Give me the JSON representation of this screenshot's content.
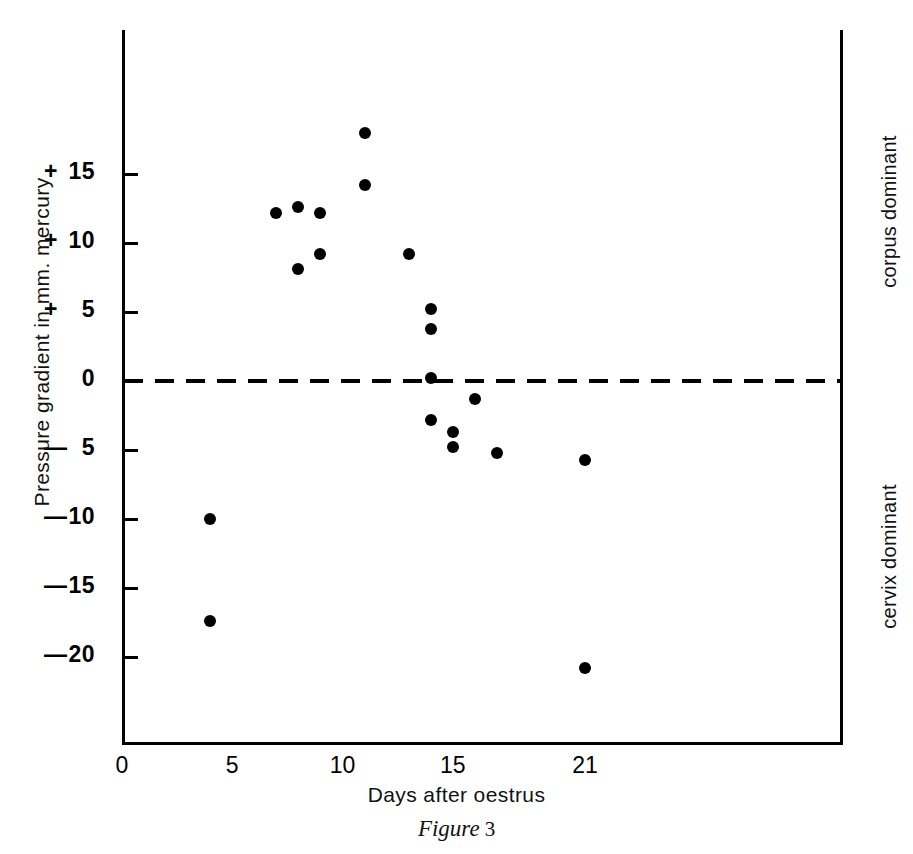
{
  "figure": {
    "caption_label": "Figure",
    "caption_number": "3"
  },
  "chart_data": {
    "type": "scatter",
    "title": "",
    "xlabel": "Days after oestrus",
    "ylabel": "Pressure gradient in mm. mercury",
    "xlim": [
      0,
      21.6
    ],
    "ylim": [
      -21.5,
      19.5
    ],
    "grid": false,
    "legend": "none",
    "xticks": [
      0,
      5,
      10,
      15,
      21
    ],
    "xtick_labels": [
      "0",
      "5",
      "10",
      "15",
      "21"
    ],
    "yticks": [
      15,
      10,
      5,
      0,
      -5,
      -10,
      -15,
      -20
    ],
    "ytick_labels": [
      "+15",
      "+10",
      "+ 5",
      "0",
      "— 5",
      "—10",
      "—15",
      "—20"
    ],
    "ytick_signs": [
      "+",
      "+",
      "+",
      "",
      "—",
      "—",
      "—",
      "—"
    ],
    "ytick_numbers": [
      "15",
      "10",
      "5",
      "0",
      "5",
      "10",
      "15",
      "20"
    ],
    "reference_line": {
      "y": 0,
      "style": "dashed",
      "label": ""
    },
    "annotations": [
      {
        "text": "corpus dominant",
        "position": "right-upper",
        "rotation": -90
      },
      {
        "text": "cervix dominant",
        "position": "right-lower",
        "rotation": -90
      }
    ],
    "points": [
      {
        "x": 4,
        "y": -10.0
      },
      {
        "x": 4,
        "y": -17.4
      },
      {
        "x": 7,
        "y": 12.2
      },
      {
        "x": 8,
        "y": 12.6
      },
      {
        "x": 8,
        "y": 8.1
      },
      {
        "x": 9,
        "y": 12.2
      },
      {
        "x": 9,
        "y": 9.2
      },
      {
        "x": 11,
        "y": 18.0
      },
      {
        "x": 11,
        "y": 14.2
      },
      {
        "x": 13,
        "y": 9.2
      },
      {
        "x": 14,
        "y": 5.2
      },
      {
        "x": 14,
        "y": 3.8
      },
      {
        "x": 14,
        "y": 0.2
      },
      {
        "x": 14,
        "y": -2.8
      },
      {
        "x": 15,
        "y": -3.7
      },
      {
        "x": 15,
        "y": -4.8
      },
      {
        "x": 16,
        "y": -1.3
      },
      {
        "x": 17,
        "y": -5.2
      },
      {
        "x": 21,
        "y": -5.7
      },
      {
        "x": 21,
        "y": -20.8
      }
    ],
    "marker": {
      "shape": "circle",
      "color": "#000000",
      "size": 12
    }
  }
}
